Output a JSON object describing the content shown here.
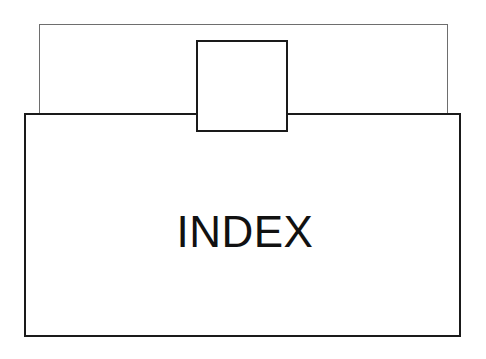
{
  "diagram": {
    "title": "INDEX",
    "background_color": "#ffffff",
    "line_color_back": "#6e6e6e",
    "line_color_front": "#1a1a1a",
    "text_color": "#111111",
    "shapes": [
      {
        "name": "back-panel",
        "label": "",
        "x": 39,
        "y": 24,
        "width": 409,
        "height": 301,
        "stroke": "#6e6e6e",
        "stroke_width": 1.6
      },
      {
        "name": "tab-square",
        "label": "",
        "x": 196,
        "y": 40,
        "width": 92,
        "height": 92,
        "stroke": "#1a1a1a",
        "stroke_width": 2.6
      },
      {
        "name": "front-panel",
        "label": "INDEX",
        "x": 24,
        "y": 113,
        "width": 437,
        "height": 224,
        "stroke": "#1a1a1a",
        "stroke_width": 2.6
      }
    ],
    "label": {
      "text": "INDEX",
      "font_size_px": 44,
      "center_x": 243,
      "baseline_y": 241
    }
  }
}
